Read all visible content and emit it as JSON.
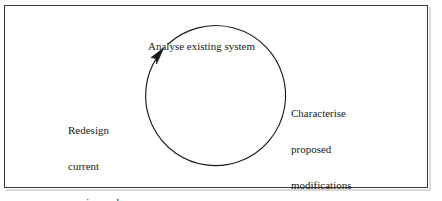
{
  "figure": {
    "type": "cycle-diagram",
    "background_color": "#ffffff",
    "frame_color": "#3a3a3a",
    "stroke_color": "#1a1a1a",
    "text_color": "#1a1a1a",
    "direction": "clockwise"
  },
  "stages": {
    "top": {
      "name": "analyse-existing-system",
      "lines": [
        "Analyse existing system"
      ],
      "text": "Analyse existing system"
    },
    "right": {
      "name": "characterise-proposed-modifications",
      "lines": [
        "Characterise",
        "proposed",
        "modifications"
      ],
      "text": "Characterise proposed modifications"
    },
    "left": {
      "name": "redesign-current-version-and-implement",
      "lines": [
        "Redesign",
        "current",
        "version and",
        "implement"
      ],
      "text": "Redesign current version and implement"
    }
  }
}
